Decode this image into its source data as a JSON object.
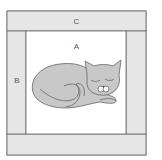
{
  "diagram": {
    "type": "quilt-block",
    "labels": {
      "top_strip": "C",
      "side_strip": "B",
      "center": "A"
    },
    "colors": {
      "strip_fill": "#e6e6e6",
      "center_fill": "#ffffff",
      "cat_fill": "#c8c8c8",
      "outline": "#666666"
    },
    "center_content": "sleeping-cat-applique"
  }
}
